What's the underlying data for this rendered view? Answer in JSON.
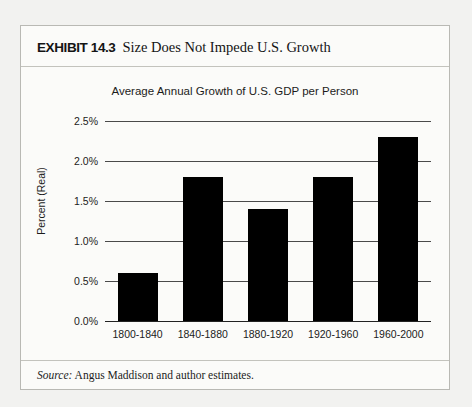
{
  "exhibit": {
    "label": "EXHIBIT 14.3",
    "caption": "Size Does Not Impede U.S. Growth",
    "source_label": "Source:",
    "source_text": "Angus Maddison and author estimates."
  },
  "colors": {
    "bar": "#000000",
    "grid": "#4a4a4a",
    "frame": "#b9b9b4",
    "panel": "#fbfbf9",
    "page": "#f2f2f0"
  },
  "chart_data": {
    "type": "bar",
    "title": "Average Annual Growth of U.S. GDP per Person",
    "xlabel": "",
    "ylabel": "Percent (Real)",
    "categories": [
      "1800-1840",
      "1840-1880",
      "1880-1920",
      "1920-1960",
      "1960-2000"
    ],
    "values": [
      0.6,
      1.8,
      1.4,
      1.8,
      2.3
    ],
    "ylim": [
      0.0,
      2.5
    ],
    "ytick_values": [
      0.0,
      0.5,
      1.0,
      1.5,
      2.0,
      2.5
    ],
    "ytick_labels": [
      "0.0%",
      "0.5%",
      "1.0%",
      "1.5%",
      "2.0%",
      "2.5%"
    ],
    "grid": true,
    "legend": false
  }
}
